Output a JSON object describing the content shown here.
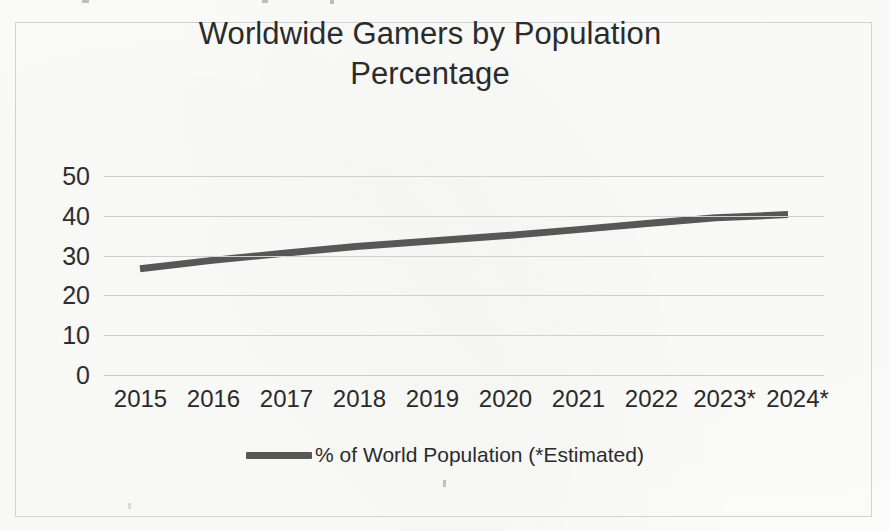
{
  "chart_data": {
    "type": "line",
    "title": "Worldwide Gamers by Population Percentage",
    "title_line1": "Worldwide Gamers by Population",
    "title_line2": "Percentage",
    "xlabel": "",
    "ylabel": "",
    "categories": [
      "2015",
      "2016",
      "2017",
      "2018",
      "2019",
      "2020",
      "2021",
      "2022",
      "2023*",
      "2024*"
    ],
    "yticks": [
      50,
      40,
      30,
      20,
      10,
      0
    ],
    "ylim": [
      0,
      50
    ],
    "grid": true,
    "legend_position": "bottom",
    "series": [
      {
        "name": "% of World Population (*Estimated)",
        "color": "#575757",
        "line_width_px": 7,
        "values": [
          26.7,
          28.8,
          30.6,
          32.3,
          33.6,
          34.9,
          36.4,
          38.0,
          39.5,
          40.3
        ]
      }
    ]
  },
  "legend": {
    "entries": [
      {
        "label": "% of World Population (*Estimated)",
        "color": "#575757"
      }
    ]
  },
  "colors": {
    "series": "#575757",
    "gridline": "#cfcfcf",
    "frame": "#d2d2d2",
    "text": "#2b2b2b",
    "background": "#fdfdfc"
  }
}
